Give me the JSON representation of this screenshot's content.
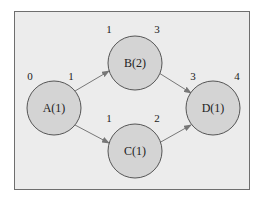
{
  "diagram": {
    "type": "activity-network",
    "colors": {
      "background": "#ececec",
      "frame_border": "#6e6e6e",
      "node_fill": "#d4d4d4",
      "node_stroke": "#555555",
      "arrow": "#777777"
    },
    "nodes": [
      {
        "id": "A",
        "label": "A(1)",
        "start": "0",
        "end": "1"
      },
      {
        "id": "B",
        "label": "B(2)",
        "start": "1",
        "end": "3"
      },
      {
        "id": "C",
        "label": "C(1)",
        "start": "1",
        "end": "2"
      },
      {
        "id": "D",
        "label": "D(1)",
        "start": "3",
        "end": "4"
      }
    ],
    "edges": [
      {
        "from": "A",
        "to": "B"
      },
      {
        "from": "A",
        "to": "C"
      },
      {
        "from": "B",
        "to": "D"
      },
      {
        "from": "C",
        "to": "D"
      }
    ]
  }
}
